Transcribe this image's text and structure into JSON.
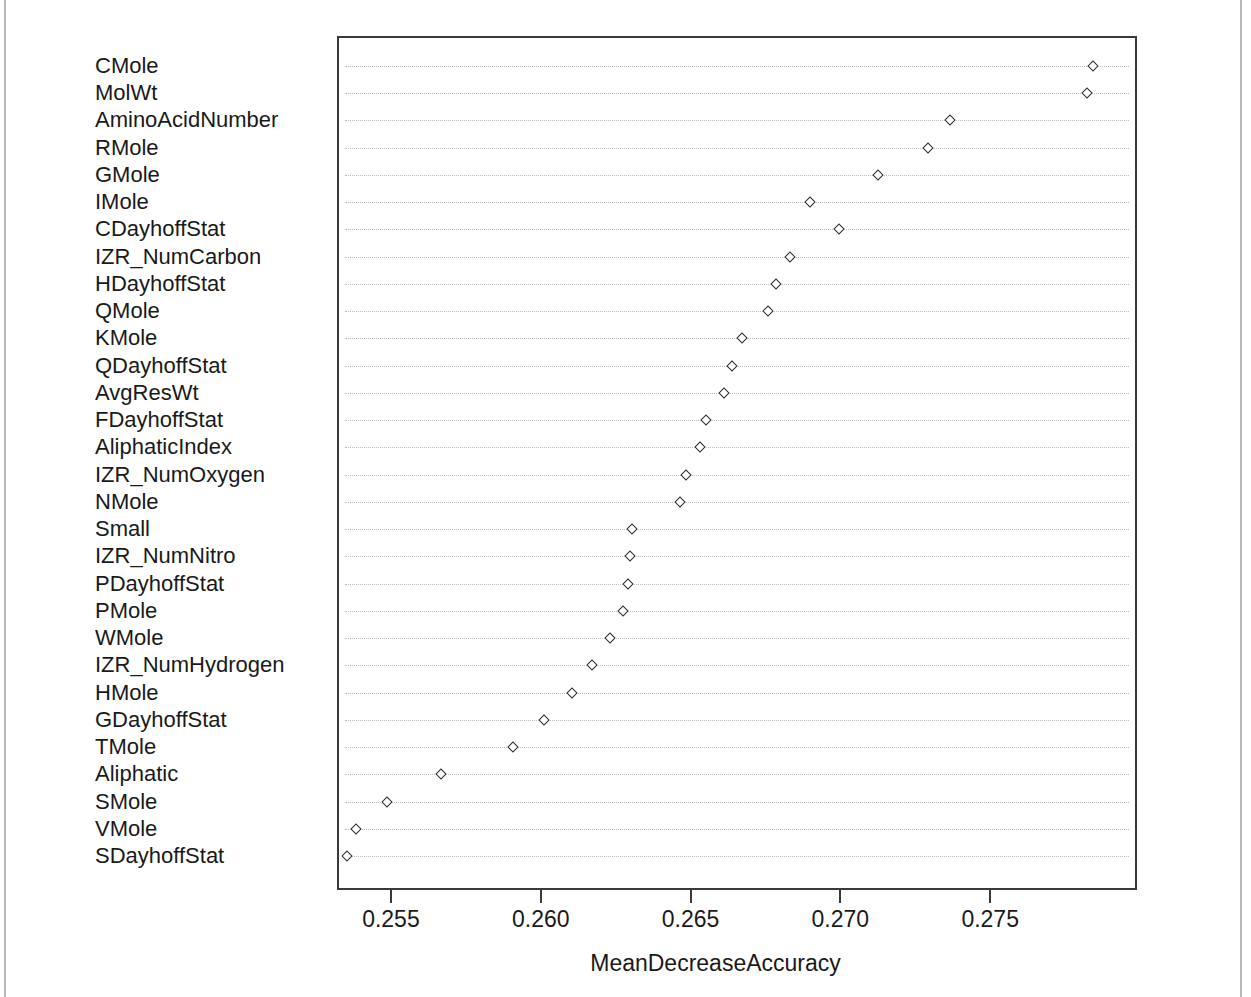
{
  "figure": {
    "background_color": "#ffffff",
    "frame_color": "#3a3a3a",
    "gridline_color": "#bdbdbd",
    "marker_color": "#2b2b2b"
  },
  "chart_data": {
    "type": "scatter",
    "title": "",
    "xlabel": "MeanDecreaseAccuracy",
    "ylabel": "",
    "grid": true,
    "legend": false,
    "orientation": "horizontal",
    "xlim": [
      0.2532,
      0.2799
    ],
    "xticks": [
      0.255,
      0.26,
      0.265,
      0.27,
      0.275
    ],
    "xtick_labels": [
      "0.255",
      "0.260",
      "0.265",
      "0.270",
      "0.275"
    ],
    "categories": [
      "CMole",
      "MolWt",
      "AminoAcidNumber",
      "RMole",
      "GMole",
      "IMole",
      "CDayhoffStat",
      "IZR_NumCarbon",
      "HDayhoffStat",
      "QMole",
      "KMole",
      "QDayhoffStat",
      "AvgResWt",
      "FDayhoffStat",
      "AliphaticIndex",
      "IZR_NumOxygen",
      "NMole",
      "Small",
      "IZR_NumNitro",
      "PDayhoffStat",
      "PMole",
      "WMole",
      "IZR_NumHydrogen",
      "HMole",
      "GDayhoffStat",
      "TMole",
      "Aliphatic",
      "SMole",
      "VMole",
      "SDayhoffStat"
    ],
    "values": [
      0.27843,
      0.27823,
      0.27367,
      0.27293,
      0.27127,
      0.269,
      0.26997,
      0.26832,
      0.26786,
      0.26759,
      0.26672,
      0.26639,
      0.26612,
      0.26552,
      0.26532,
      0.26485,
      0.26465,
      0.26304,
      0.26298,
      0.26291,
      0.26274,
      0.26231,
      0.26171,
      0.26104,
      0.26011,
      0.25907,
      0.25667,
      0.25486,
      0.25385,
      0.25355
    ]
  }
}
